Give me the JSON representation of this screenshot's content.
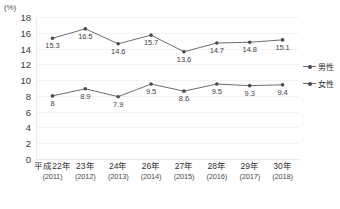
{
  "chart_data": {
    "type": "line",
    "title": "",
    "xlabel": "",
    "ylabel": "",
    "unit_label": "(%)",
    "ylim": [
      0,
      18
    ],
    "ytick_step": 2,
    "yticks": [
      "18",
      "16",
      "14",
      "12",
      "10",
      "8",
      "6",
      "4",
      "2",
      "0"
    ],
    "grid": true,
    "legend_position": "right",
    "categories": [
      "平成22年",
      "23年",
      "24年",
      "26年",
      "27年",
      "28年",
      "29年",
      "30年"
    ],
    "category_subs": [
      "(2011)",
      "(2012)",
      "(2013)",
      "(2014)",
      "(2015)",
      "(2016)",
      "(2017)",
      "(2018)"
    ],
    "series": [
      {
        "name": "男性",
        "color": "#6e6e6e",
        "values": [
          15.3,
          16.5,
          14.6,
          15.7,
          13.6,
          14.7,
          14.8,
          15.1
        ],
        "labels": [
          "15.3",
          "16.5",
          "14.6",
          "15.7",
          "13.6",
          "14.7",
          "14.8",
          "15.1"
        ],
        "label_positions": [
          "below",
          "below",
          "below",
          "below",
          "below",
          "below",
          "below",
          "below"
        ]
      },
      {
        "name": "女性",
        "color": "#6e6e6e",
        "values": [
          8.0,
          8.9,
          7.9,
          9.5,
          8.6,
          9.5,
          9.3,
          9.4
        ],
        "labels": [
          "8",
          "8.9",
          "7.9",
          "9.5",
          "8.6",
          "9.5",
          "9.3",
          "9.4"
        ],
        "label_positions": [
          "below",
          "below",
          "below",
          "below",
          "below",
          "below",
          "below",
          "below"
        ]
      }
    ],
    "legend": [
      "男性",
      "女性"
    ]
  },
  "caption": ""
}
